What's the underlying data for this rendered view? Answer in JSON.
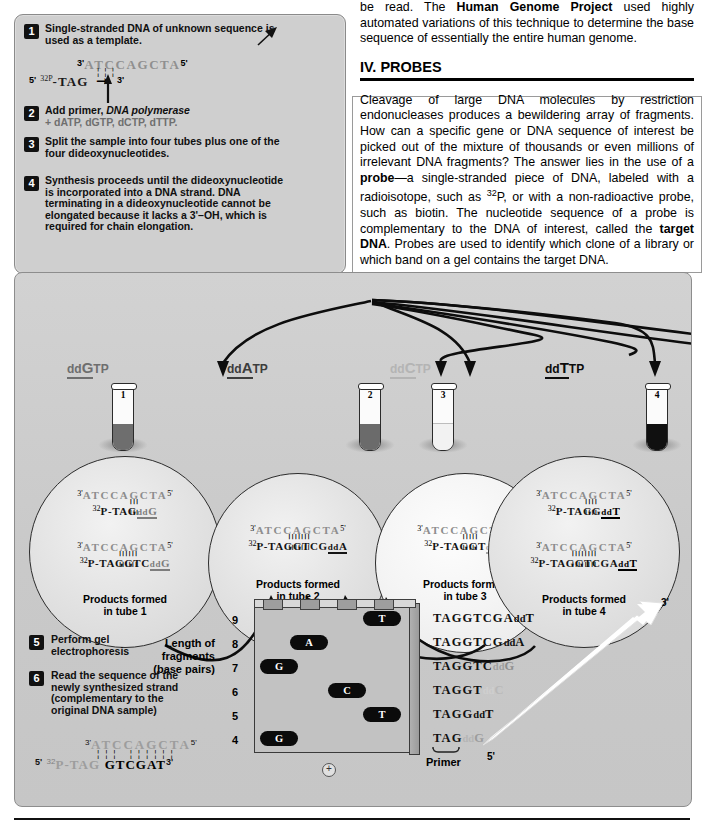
{
  "steps": [
    {
      "num": "1",
      "text_html": "Single-stranded DNA of unknown sequence is used as a template.",
      "plain": "Single-stranded DNA of unknown sequence is used as a template."
    },
    {
      "num": "2",
      "line1": "Add primer, ",
      "italic": "DNA polymerase",
      "line2": "+ dATP, dGTP, dCTP, dTTP."
    },
    {
      "num": "3",
      "plain": "Split the sample into four tubes plus one of the four dideoxynucleotides."
    },
    {
      "num": "4",
      "plain": "Synthesis proceeds until the dideoxynucleotide is incorporated into a DNA strand. DNA terminating in a dideoxynucleotide cannot be elongated because it lacks a 3'–OH, which is required for chain elongation."
    },
    {
      "num": "5",
      "plain": "Perform gel electrophoresis"
    },
    {
      "num": "6",
      "plain": "Read the sequence of the newly synthesized strand (complementary to the original DNA sample)"
    }
  ],
  "template_seq": {
    "top_prime": "3'",
    "top_bases": "ATCCAGCTA",
    "top_end": "5'",
    "left_prime": "5'",
    "label_p": "32P",
    "bottom_bases": "-TAG",
    "bottom_end": "3'"
  },
  "right_column": {
    "para1": "be read. The Human Genome Project used highly automated variations of this technique to determine the base sequence of essentially the entire human genome.",
    "heading": "IV.  PROBES",
    "para2": "Cleavage of large DNA molecules by restriction endonucleases produces a bewildering array of fragments. How can a specific gene or DNA sequence of interest be picked out of the mixture of thousands or even millions of irrelevant DNA fragments? The answer lies in the use of a probe—a single-stranded piece of DNA, labeled with a radioisotope, such as 32P, or with a non-radioactive probe, such as biotin. The nucleotide sequence of a probe is complementary to the DNA of interest, called the target DNA. Probes are used to identify which clone of a library or which band on a gel contains the target DNA.",
    "bold_terms": [
      "Human Genome Project",
      "probe",
      "target DNA"
    ]
  },
  "tubes": [
    {
      "id": "1",
      "label_dd": "dd",
      "label_base": "G",
      "label_tp": "TP",
      "fill_color": "#6e6e6e",
      "base_color": "#5e5e5e",
      "label_color": "#6e6e6e"
    },
    {
      "id": "2",
      "label_dd": "dd",
      "label_base": "A",
      "label_tp": "TP",
      "fill_color": "#6b6b6b",
      "base_color": "#4a4a4a",
      "label_color": "#4a4a4a"
    },
    {
      "id": "3",
      "label_dd": "dd",
      "label_base": "C",
      "label_tp": "TP",
      "fill_color": "#f4f4f4",
      "base_color": "#b6b6b6",
      "label_color": "#b6b6b6"
    },
    {
      "id": "4",
      "label_dd": "dd",
      "label_base": "T",
      "label_tp": "TP",
      "fill_color": "#111111",
      "base_color": "#111111",
      "label_color": "#111111"
    }
  ],
  "product_circles": [
    {
      "caption_l1": "Products formed",
      "caption_l2": "in tube 1",
      "rows": [
        {
          "top3": "3'",
          "top": "ATCCAGCTA",
          "top5": "5'",
          "p": "32",
          "pl": "P-TAG",
          "dd": "dd",
          "base": "G",
          "dd_color": "#7d7d7d",
          "ticks": 3
        },
        {
          "top3": "3'",
          "top": "ATCCAGCTA",
          "top5": "5'",
          "p": "32",
          "pl": "P-TAGGTC",
          "dd": "dd",
          "base": "G",
          "dd_color": "#7d7d7d",
          "ticks": 6
        }
      ]
    },
    {
      "caption_l1": "Products formed",
      "caption_l2": "in tube 2",
      "rows": [
        {
          "top3": "3'",
          "top": "ATCCAGCTA",
          "top5": "5'",
          "p": "32",
          "pl": "P-TAGGTCG",
          "dd": "dd",
          "base": "A",
          "dd_color": "#1a1a1a",
          "ticks": 7
        }
      ]
    },
    {
      "caption_l1": "Products formed",
      "caption_l2": "in tube 3",
      "rows": [
        {
          "top3": "3'",
          "top": "ATCCAGCTA",
          "top5": "5'",
          "p": "32",
          "pl": "P-TAGGT",
          "dd": "dd",
          "base": "C",
          "dd_color": "#a9a9a9",
          "ticks": 5
        }
      ]
    },
    {
      "caption_l1": "Products formed",
      "caption_l2": "in tube 4",
      "rows": [
        {
          "top3": "3'",
          "top": "ATCCAGCTA",
          "top5": "5'",
          "p": "32",
          "pl": "P-TAGG",
          "dd": "dd",
          "base": "T",
          "dd_color": "#000000",
          "ticks": 4
        },
        {
          "top3": "3'",
          "top": "ATCCAGCTA",
          "top5": "5'",
          "p": "32",
          "pl": "P-TAGGTCGA",
          "dd": "dd",
          "base": "T",
          "dd_color": "#000000",
          "ticks": 8
        }
      ]
    }
  ],
  "gel": {
    "axis_label_l1": "Length of",
    "axis_label_l2": "fragments",
    "axis_label_l3": "(base pairs)",
    "tick_labels": [
      "9",
      "8",
      "7",
      "6",
      "5",
      "4"
    ],
    "lane_count": 4,
    "plus_symbol": "+",
    "bands": [
      {
        "lane": 4,
        "size": 9,
        "letter": "T"
      },
      {
        "lane": 2,
        "size": 8,
        "letter": "A"
      },
      {
        "lane": 1,
        "size": 7,
        "letter": "G"
      },
      {
        "lane": 3,
        "size": 6,
        "letter": "C"
      },
      {
        "lane": 4,
        "size": 5,
        "letter": "T"
      },
      {
        "lane": 1,
        "size": 4,
        "letter": "G"
      }
    ]
  },
  "ladder": [
    {
      "seq": "TAGGTCGA",
      "dd": "dd",
      "base": "T",
      "base_color": "#101010",
      "dd_color": "#101010"
    },
    {
      "seq": "TAGGTCG",
      "dd": "dd",
      "base": "A",
      "base_color": "#101010",
      "dd_color": "#101010"
    },
    {
      "seq": "TAGGTC",
      "dd": "dd",
      "base": "G",
      "base_color": "#8f8f8f",
      "dd_color": "#8f8f8f"
    },
    {
      "seq": "TAGGT",
      "dd": "dd",
      "base": "C",
      "base_color": "#b9b9b9",
      "dd_color": "#cccccc"
    },
    {
      "seq": "TAGG",
      "dd": "dd",
      "base": "T",
      "base_color": "#101010",
      "dd_color": "#101010"
    },
    {
      "seq": "TAG",
      "dd": "dd",
      "base": "G",
      "base_color": "#9d9d9d",
      "dd_color": "#b5b5b5"
    }
  ],
  "ladder_primer_label": "Primer",
  "ladder_five_prime": "5'",
  "ladder_three_prime": "3'",
  "final_sequence": {
    "top3": "3'",
    "top": "ATCCAGCTA",
    "top5": "5'",
    "left5": "5'",
    "p": "32",
    "pl": "P-TAG",
    "read": "GTCGAT",
    "end3": "3'"
  }
}
